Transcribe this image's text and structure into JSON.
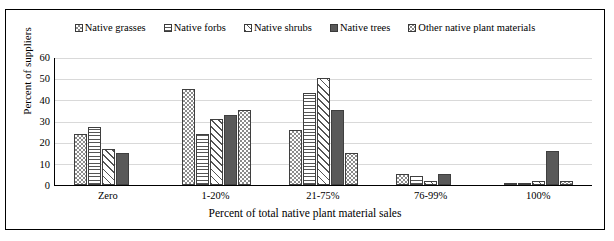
{
  "chart_data": {
    "type": "bar",
    "title": "",
    "xlabel": "Percent of total native plant material sales",
    "ylabel": "Percent of suppliers",
    "ylim": [
      0,
      60
    ],
    "yticks": [
      0,
      10,
      20,
      30,
      40,
      50,
      60
    ],
    "grid": true,
    "legend_position": "top",
    "categories": [
      "Zero",
      "1-20%",
      "21-75%",
      "76-99%",
      "100%"
    ],
    "series": [
      {
        "name": "Native grasses",
        "pattern": "checkerboard",
        "values": [
          24,
          45,
          26,
          5,
          1
        ]
      },
      {
        "name": "Native forbs",
        "pattern": "horizontal-lines",
        "values": [
          27,
          24,
          43,
          4,
          1
        ]
      },
      {
        "name": "Native shrubs",
        "pattern": "diagonal-lines",
        "values": [
          17,
          31,
          50,
          2,
          2
        ]
      },
      {
        "name": "Native trees",
        "pattern": "solid-dark",
        "values": [
          15,
          33,
          35,
          5,
          16
        ]
      },
      {
        "name": "Other native plant materials",
        "pattern": "dotted",
        "values": [
          0,
          35,
          15,
          0,
          2
        ]
      }
    ]
  },
  "colors": {
    "frame_border": "#000000",
    "axis": "#000000",
    "gridline": "#d9d9d9",
    "bar_outline": "#3f3f3f",
    "solid_dark": "#595959",
    "pattern_gray": "#8d8d8d",
    "text": "#000000"
  }
}
